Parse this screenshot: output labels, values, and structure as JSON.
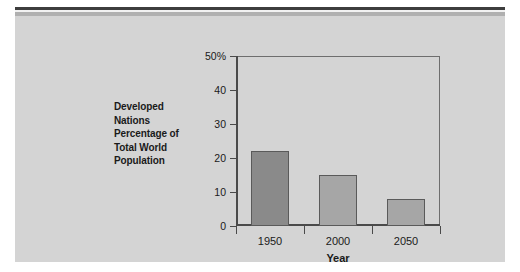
{
  "figure": {
    "background_color": "#d4d4d4",
    "page_color": "#ffffff",
    "rule_dark_color": "#3d3d3d",
    "rule_gray_color": "#b0b0b0"
  },
  "chart_data": {
    "type": "bar",
    "title": "",
    "categories": [
      "1950",
      "2000",
      "2050"
    ],
    "values": [
      22,
      15,
      8
    ],
    "series": [
      {
        "name": "Developed Nations Percentage of Total World Population",
        "values": [
          22,
          15,
          8
        ]
      }
    ],
    "xlabel": "Year",
    "ylabel": "Developed Nations Percentage of Total World Population",
    "ylabel_lines": [
      "Developed",
      "Nations",
      "Percentage of",
      "Total World",
      "Population"
    ],
    "ylim": [
      0,
      50
    ],
    "yticks": [
      0,
      10,
      20,
      30,
      40,
      50
    ],
    "ytick_labels": [
      "0",
      "10",
      "20",
      "30",
      "40",
      "50%"
    ],
    "grid": false,
    "legend": null,
    "bar_colors": [
      "#8a8a8a",
      "#a6a6a6",
      "#a6a6a6"
    ],
    "bar_edge_color": "#5a5a5a",
    "axis_color": "#4a4a4a",
    "frame_color": "#6e6e6e"
  }
}
